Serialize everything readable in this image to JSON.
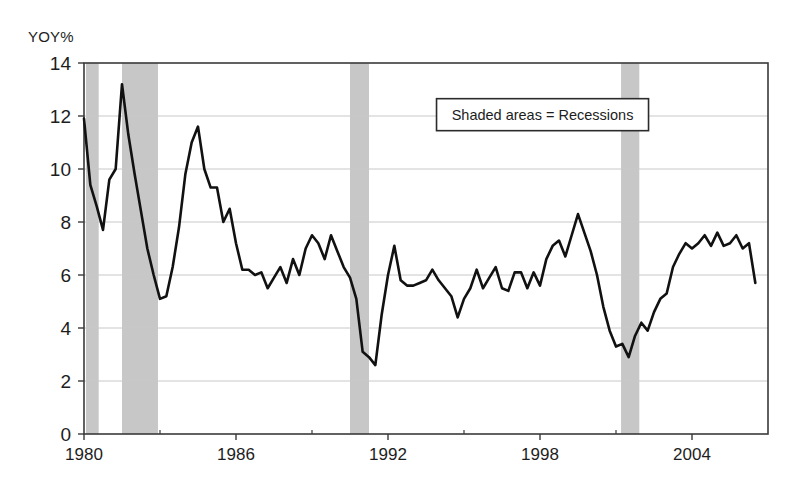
{
  "chart_data": {
    "type": "line",
    "title": "",
    "subtitle": "",
    "xlabel": "",
    "ylabel": "YOY%",
    "ylim": [
      0,
      14
    ],
    "xlim": [
      1980,
      2007
    ],
    "ytick_labels": [
      "0",
      "2",
      "4",
      "6",
      "8",
      "10",
      "12",
      "14"
    ],
    "yticks": [
      0,
      2,
      4,
      6,
      8,
      10,
      12,
      14
    ],
    "xtick_labels": [
      "1980",
      "1986",
      "1992",
      "1998",
      "2004"
    ],
    "xticks": [
      1980,
      1986,
      1992,
      1998,
      2004
    ],
    "x_minor_ticks": [
      1983,
      1989,
      1995,
      2001
    ],
    "grid": "horizontal",
    "legend_position": "inside-top-right",
    "legend_entries": [
      "Shaded areas = Recessions"
    ],
    "line_color": "#111111",
    "shade_color": "#c7c7c7",
    "grid_color": "#c8c8c8",
    "frame_color": "#3a3a3a",
    "annotations": [
      {
        "text": "Shaded areas = Recessions",
        "x": 1998.1,
        "y": 12.05
      }
    ],
    "shaded_regions": [
      {
        "label": "1980 recession",
        "x0": 1980.08,
        "x1": 1980.58
      },
      {
        "label": "1981-1982 recession",
        "x0": 1981.5,
        "x1": 1982.92
      },
      {
        "label": "1990-1991 recession",
        "x0": 1990.5,
        "x1": 1991.25
      },
      {
        "label": "2001 recession",
        "x0": 2001.2,
        "x1": 2001.92
      }
    ],
    "series": [
      {
        "name": "YOY%",
        "x": [
          1980.0,
          1980.25,
          1980.5,
          1980.75,
          1981.0,
          1981.25,
          1981.5,
          1981.75,
          1982.0,
          1982.25,
          1982.5,
          1982.75,
          1983.0,
          1983.25,
          1983.5,
          1983.75,
          1984.0,
          1984.25,
          1984.5,
          1984.75,
          1985.0,
          1985.25,
          1985.5,
          1985.75,
          1986.0,
          1986.25,
          1986.5,
          1986.75,
          1987.0,
          1987.25,
          1987.5,
          1987.75,
          1988.0,
          1988.25,
          1988.5,
          1988.75,
          1989.0,
          1989.25,
          1989.5,
          1989.75,
          1990.0,
          1990.25,
          1990.5,
          1990.75,
          1991.0,
          1991.25,
          1991.5,
          1991.75,
          1992.0,
          1992.25,
          1992.5,
          1992.75,
          1993.0,
          1993.25,
          1993.5,
          1993.75,
          1994.0,
          1994.25,
          1994.5,
          1994.75,
          1995.0,
          1995.25,
          1995.5,
          1995.75,
          1996.0,
          1996.25,
          1996.5,
          1996.75,
          1997.0,
          1997.25,
          1997.5,
          1997.75,
          1998.0,
          1998.25,
          1998.5,
          1998.75,
          1999.0,
          1999.25,
          1999.5,
          1999.75,
          2000.0,
          2000.25,
          2000.5,
          2000.75,
          2001.0,
          2001.25,
          2001.5,
          2001.75,
          2002.0,
          2002.25,
          2002.5,
          2002.75,
          2003.0,
          2003.25,
          2003.5,
          2003.75,
          2004.0,
          2004.25,
          2004.5,
          2004.75,
          2005.0,
          2005.25,
          2005.5,
          2005.75,
          2006.0,
          2006.25,
          2006.5
        ],
        "values": [
          11.9,
          9.4,
          8.6,
          7.7,
          9.6,
          10.0,
          13.2,
          11.3,
          9.8,
          8.4,
          7.0,
          6.0,
          5.1,
          5.2,
          6.3,
          7.8,
          9.8,
          11.0,
          11.6,
          10.0,
          9.3,
          9.3,
          8.0,
          8.5,
          7.2,
          6.2,
          6.2,
          6.0,
          6.1,
          5.5,
          5.9,
          6.3,
          5.7,
          6.6,
          6.0,
          7.0,
          7.5,
          7.2,
          6.6,
          7.5,
          6.9,
          6.3,
          5.9,
          5.1,
          3.1,
          2.9,
          2.6,
          4.5,
          6.0,
          7.1,
          5.8,
          5.6,
          5.6,
          5.7,
          5.8,
          6.2,
          5.8,
          5.5,
          5.2,
          4.4,
          5.1,
          5.5,
          6.2,
          5.5,
          5.9,
          6.3,
          5.5,
          5.4,
          6.1,
          6.1,
          5.5,
          6.1,
          5.6,
          6.6,
          7.1,
          7.3,
          6.7,
          7.5,
          8.3,
          7.6,
          6.9,
          6.0,
          4.8,
          3.9,
          3.3,
          3.4,
          2.9,
          3.7,
          4.2,
          3.9,
          4.6,
          5.1,
          5.3,
          6.3,
          6.8,
          7.2,
          7.0,
          7.2,
          7.5,
          7.1,
          7.6,
          7.1,
          7.2,
          7.5,
          7.0,
          7.2,
          5.7
        ]
      }
    ]
  },
  "legend": {
    "box_label": "Shaded areas = Recessions"
  },
  "axes": {
    "y_axis_title": "YOY%"
  }
}
